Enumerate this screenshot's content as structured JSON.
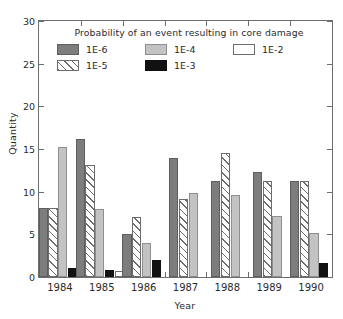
{
  "chart_data": {
    "type": "bar",
    "title": "",
    "legend_title": "Probability of an event resulting in core damage",
    "legend_position": "upper-center-inside",
    "xlabel": "Year",
    "ylabel": "Quantity",
    "categories": [
      "1984",
      "1985",
      "1986",
      "1987",
      "1988",
      "1989",
      "1990"
    ],
    "ylim": [
      0,
      30
    ],
    "yticks": [
      "0",
      "5",
      "10",
      "15",
      "20",
      "25",
      "30"
    ],
    "grid": false,
    "series": [
      {
        "name": "1E-6",
        "color": "#7d7d7d",
        "pattern": "solid",
        "values": [
          8.1,
          16.2,
          5.0,
          14.0,
          11.3,
          12.3,
          11.3
        ]
      },
      {
        "name": "1E-5",
        "color": "#ffffff",
        "pattern": "diagonal-hatch",
        "values": [
          8.1,
          13.1,
          7.0,
          9.1,
          14.5,
          11.3,
          11.3
        ]
      },
      {
        "name": "1E-4",
        "color": "#c3c3c3",
        "pattern": "solid",
        "values": [
          15.2,
          8.0,
          4.0,
          9.9,
          9.6,
          7.2,
          5.2
        ]
      },
      {
        "name": "1E-3",
        "color": "#111111",
        "pattern": "solid",
        "values": [
          1.0,
          0.8,
          2.0,
          0,
          0,
          0,
          1.7
        ]
      },
      {
        "name": "1E-2",
        "color": "#ffffff",
        "pattern": "solid",
        "values": [
          0,
          0.7,
          0,
          0,
          0,
          0,
          0
        ]
      }
    ]
  }
}
